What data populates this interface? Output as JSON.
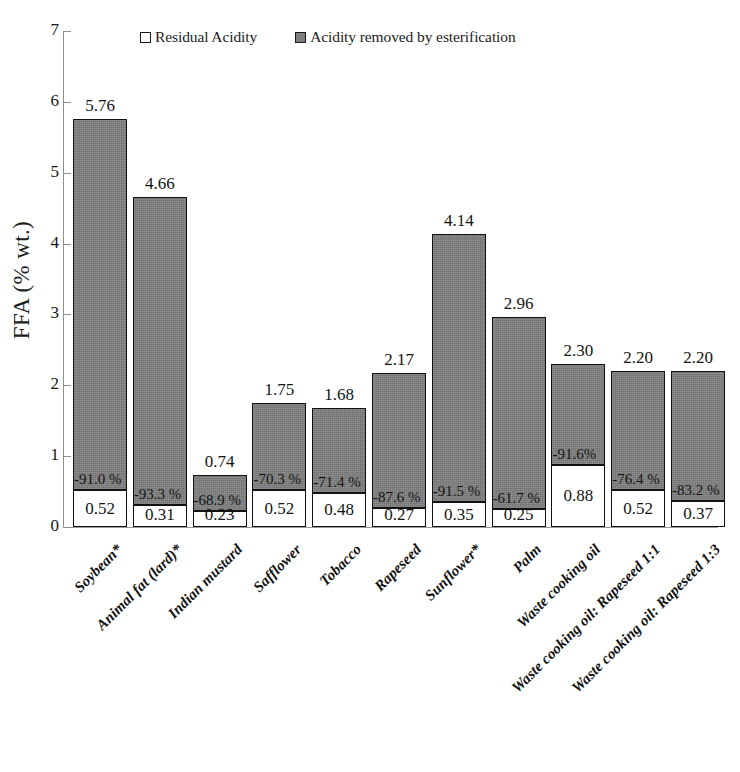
{
  "chart_data": {
    "type": "bar",
    "subtype": "stacked",
    "title": "",
    "xlabel": "",
    "ylabel": "FFA (% wt.)",
    "ylim": [
      0,
      7
    ],
    "ytick_labels": [
      "0",
      "1",
      "2",
      "3",
      "4",
      "5",
      "6",
      "7"
    ],
    "yticks": [
      0,
      1,
      2,
      3,
      4,
      5,
      6,
      7
    ],
    "grid": false,
    "legend_position": "top",
    "categories": [
      "Soybean*",
      "Animal fat (lard)*",
      "Indian mustard",
      "Safflower",
      "Tobacco",
      "Rapeseed",
      "Sunflower*",
      "Palm",
      "Waste cooking oil",
      "Waste cooking oil: Rapeseed 1:1",
      "Waste cooking oil: Rapeseed 1:3"
    ],
    "series": [
      {
        "name": "Residual Acidity",
        "color": "#ffffff",
        "values": [
          0.52,
          0.31,
          0.23,
          0.52,
          0.48,
          0.27,
          0.35,
          0.25,
          0.88,
          0.52,
          0.37
        ]
      },
      {
        "name": "Acidity removed by esterification",
        "color": "#808080",
        "values": [
          5.24,
          4.35,
          0.51,
          1.23,
          1.2,
          1.9,
          3.79,
          2.71,
          2.42,
          1.68,
          1.83
        ]
      }
    ],
    "totals": [
      5.76,
      4.66,
      0.74,
      1.75,
      1.68,
      2.17,
      4.14,
      2.96,
      2.3,
      2.2,
      2.2
    ],
    "total_labels": [
      "5.76",
      "4.66",
      "0.74",
      "1.75",
      "1.68",
      "2.17",
      "4.14",
      "2.96",
      "2.30",
      "2.20",
      "2.20"
    ],
    "residual_labels": [
      "0.52",
      "0.31",
      "0.23",
      "0.52",
      "0.48",
      "0.27",
      "0.35",
      "0.25",
      "0.88",
      "0.52",
      "0.37"
    ],
    "percent_labels": [
      "-91.0 %",
      "-93.3 %",
      "-68.9 %",
      "-70.3 %",
      "-71.4 %",
      "-87.6 %",
      "-91.5 %",
      "-61.7 %",
      "-91.6%",
      "-76.4 %",
      "-83.2 %"
    ],
    "percent_values": [
      -91.0,
      -93.3,
      -68.9,
      -70.3,
      -71.4,
      -87.6,
      -91.5,
      -61.7,
      -91.6,
      -76.4,
      -83.2
    ]
  },
  "legend": {
    "items": [
      {
        "label": "Residual Acidity",
        "swatch": "white-square",
        "color": "#ffffff"
      },
      {
        "label": "Acidity removed by esterification",
        "swatch": "gray-square",
        "color": "#808080"
      }
    ]
  },
  "axes": {
    "y_title": "FFA (% wt.)"
  }
}
